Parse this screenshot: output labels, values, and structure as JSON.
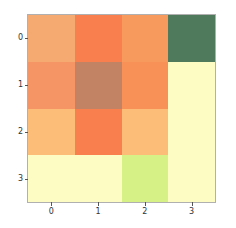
{
  "chart_data": {
    "type": "heatmap",
    "title": "",
    "xlabel": "",
    "ylabel": "",
    "grid": false,
    "legend": "none",
    "colorbar": false,
    "colormap": "RdYlGn",
    "x_tick_labels": [
      "0",
      "1",
      "2",
      "3"
    ],
    "y_tick_labels": [
      "0",
      "1",
      "2",
      "3"
    ],
    "xlim": [
      -0.5,
      3.5
    ],
    "ylim": [
      3.5,
      -0.5
    ],
    "row_labels": [
      "0",
      "1",
      "2",
      "3"
    ],
    "col_labels": [
      "0",
      "1",
      "2",
      "3"
    ],
    "values": [
      [
        0.38,
        0.22,
        0.27,
        0.92
      ],
      [
        0.28,
        0.33,
        0.27,
        0.56
      ],
      [
        0.43,
        0.22,
        0.42,
        0.56
      ],
      [
        0.55,
        0.55,
        0.68,
        0.56
      ]
    ],
    "colors": [
      [
        "#f5aa72",
        "#fa7f4e",
        "#f79a5e",
        "#4f7a5c"
      ],
      [
        "#f59465",
        "#c28364",
        "#f89158",
        "#fcfcc3"
      ],
      [
        "#fbbd78",
        "#fa7f4e",
        "#fbbd78",
        "#fcfcc3"
      ],
      [
        "#fcfcc3",
        "#fcfcc3",
        "#d6f185",
        "#fcfcc3"
      ]
    ],
    "axes_edge_color": "#b0b0b0",
    "tick_color": "#555555",
    "tick_label_color": "#333333",
    "background_color": "#ffffff"
  }
}
